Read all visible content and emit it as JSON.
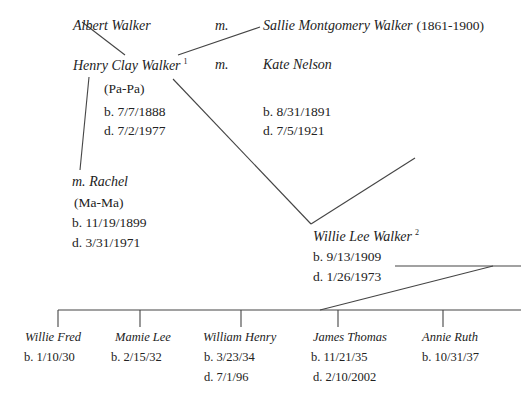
{
  "generation1": {
    "father": {
      "name": "Albert Walker"
    },
    "marriage": "m.",
    "mother": {
      "name": "Sallie Montgomery Walker",
      "years": "(1861-1900)"
    }
  },
  "generation2": {
    "person": {
      "name": "Henry Clay Walker",
      "footnote": "1",
      "nickname": "(Pa-Pa)",
      "born": "b. 7/7/1888",
      "died": "d. 7/2/1977"
    },
    "marriage": "m.",
    "spouse1": {
      "name": "Kate Nelson",
      "born": "b. 8/31/1891",
      "died": "d. 7/5/1921"
    },
    "spouse2": {
      "marriage": "m.",
      "name": "Rachel",
      "nickname": "(Ma-Ma)",
      "born": "b. 11/19/1899",
      "died": "d. 3/31/1971"
    }
  },
  "generation3": {
    "person": {
      "name": "Willie Lee Walker",
      "footnote": "2",
      "born": "b. 9/13/1909",
      "died": "d. 1/26/1973"
    }
  },
  "children": [
    {
      "name": "Willie Fred",
      "born": "b. 1/10/30",
      "died": ""
    },
    {
      "name": "Mamie Lee",
      "born": "b. 2/15/32",
      "died": ""
    },
    {
      "name": "William Henry",
      "born": "b. 3/23/34",
      "died": "d. 7/1/96"
    },
    {
      "name": "James Thomas",
      "born": "b. 11/21/35",
      "died": "d. 2/10/2002"
    },
    {
      "name": "Annie Ruth",
      "born": "b. 10/31/37",
      "died": ""
    }
  ],
  "colors": {
    "line": "#444444",
    "text": "#222222",
    "background": "#ffffff"
  }
}
